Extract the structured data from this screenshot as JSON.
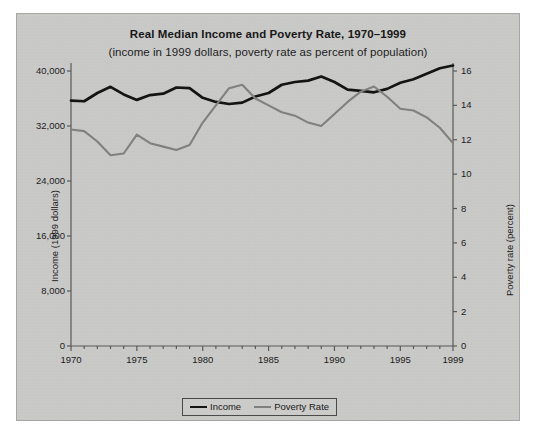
{
  "chart_data": {
    "type": "line",
    "title": "Real Median Income and Poverty Rate, 1970–1999",
    "subtitle": "(income in 1999 dollars, poverty rate as percent of population)",
    "xlabel": "",
    "ylabel": "Income (1999 dollars)",
    "ylabel_right": "Poverty rate (percent)",
    "xlim": [
      1970,
      1999
    ],
    "ylim": [
      0,
      40000
    ],
    "ylim_right": [
      0,
      16
    ],
    "grid": false,
    "legend_position": "bottom-center",
    "xticks": [
      "1970",
      "1975",
      "1980",
      "1985",
      "1990",
      "1995",
      "1999"
    ],
    "xtick_values": [
      1970,
      1975,
      1980,
      1985,
      1990,
      1995,
      1999
    ],
    "yticks_left": [
      "0",
      "8,000",
      "16,000",
      "24,000",
      "32,000",
      "40,000"
    ],
    "ytick_values_left": [
      0,
      8000,
      16000,
      24000,
      32000,
      40000
    ],
    "yticks_right": [
      "0",
      "2",
      "4",
      "6",
      "8",
      "10",
      "12",
      "14",
      "16"
    ],
    "ytick_values_right": [
      0,
      2,
      4,
      6,
      8,
      10,
      12,
      14,
      16
    ],
    "x": [
      1970,
      1971,
      1972,
      1973,
      1974,
      1975,
      1976,
      1977,
      1978,
      1979,
      1980,
      1981,
      1982,
      1983,
      1984,
      1985,
      1986,
      1987,
      1988,
      1989,
      1990,
      1991,
      1992,
      1993,
      1994,
      1995,
      1996,
      1997,
      1998,
      1999
    ],
    "series": [
      {
        "name": "Income",
        "axis": "left",
        "color": "#141414",
        "values": [
          35700,
          35600,
          36800,
          37700,
          36600,
          35800,
          36500,
          36700,
          37600,
          37500,
          36100,
          35500,
          35200,
          35400,
          36300,
          36800,
          38000,
          38400,
          38600,
          39200,
          38400,
          37300,
          37100,
          36900,
          37400,
          38300,
          38800,
          39600,
          40400,
          40800
        ]
      },
      {
        "name": "Poverty Rate",
        "axis": "right",
        "color": "#808080",
        "values": [
          12.6,
          12.5,
          11.9,
          11.1,
          11.2,
          12.3,
          11.8,
          11.6,
          11.4,
          11.7,
          13.0,
          14.0,
          15.0,
          15.2,
          14.4,
          14.0,
          13.6,
          13.4,
          13.0,
          12.8,
          13.5,
          14.2,
          14.8,
          15.1,
          14.5,
          13.8,
          13.7,
          13.3,
          12.7,
          11.8
        ]
      }
    ]
  },
  "figure": {
    "background_color": "#ccccca",
    "border_color": "#a6a6a4",
    "income_color": "#141414",
    "poverty_color": "#808080",
    "axis_color": "#595957"
  }
}
